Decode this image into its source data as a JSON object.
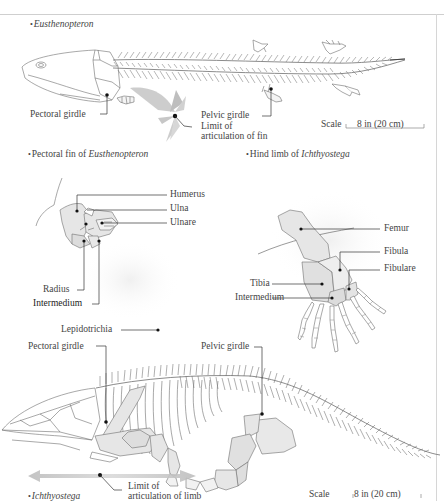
{
  "figure": {
    "panels": [
      {
        "id": "eusthenopteron",
        "caption_bullet": "•",
        "caption": "Eusthenopteron",
        "caption_italic": true,
        "labels": {
          "pectoral_girdle": "Pectoral girdle",
          "pelvic_girdle": "Pelvic girdle",
          "limit_articulation_line1": "Limit of",
          "limit_articulation_line2": "articulation of fin"
        },
        "scale": {
          "label": "Scale",
          "value": "8 in (20 cm)"
        }
      },
      {
        "id": "pectoral-fin",
        "caption_bullet": "•",
        "caption_prefix": "Pectoral fin of ",
        "caption_italic_part": "Eusthenopteron",
        "labels": {
          "humerus": "Humerus",
          "ulna": "Ulna",
          "ulnare": "Ulnare",
          "radius": "Radius",
          "intermedium": "Intermedium",
          "lepidotrichia": "Lepidotrichia"
        }
      },
      {
        "id": "hind-limb",
        "caption_bullet": "•",
        "caption_prefix": "Hind limb of ",
        "caption_italic_part": "Ichthyostega",
        "labels": {
          "femur": "Femur",
          "fibula": "Fibula",
          "fibulare": "Fibulare",
          "tibia": "Tibia",
          "intermedium": "Intermedium"
        }
      },
      {
        "id": "ichthyostega",
        "caption_bullet": "•",
        "caption": "Ichthyostega",
        "caption_italic": true,
        "labels": {
          "pectoral_girdle": "Pectoral girdle",
          "pelvic_girdle": "Pelvic girdle",
          "limit_articulation_line1": "Limit of",
          "limit_articulation_line2": "articulation of limb"
        },
        "scale": {
          "label": "Scale",
          "value": "8 in (20 cm)"
        }
      }
    ],
    "colors": {
      "bone_fill": "#e6e6e6",
      "bone_stroke": "#6e6e6e",
      "leader_line": "#333333",
      "arrow_gray": "#bdbdbd"
    }
  }
}
